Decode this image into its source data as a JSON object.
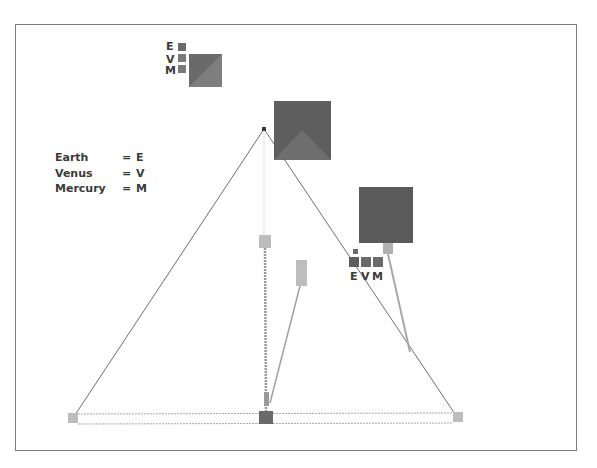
{
  "diagram": {
    "key": [
      {
        "name": "Earth",
        "eq": "=",
        "abbr": "E"
      },
      {
        "name": "Venus",
        "eq": "=",
        "abbr": "V"
      },
      {
        "name": "Mercury",
        "eq": "=",
        "abbr": "M"
      }
    ],
    "top_legend": {
      "labels": [
        "E",
        "V",
        "M"
      ]
    },
    "right_legend": {
      "labels": [
        "E",
        "V",
        "M"
      ]
    },
    "colors": {
      "frame": "#7a7a7a",
      "dark_block": "#5e5e5e",
      "medium_block": "#8a8a8a",
      "light_block": "#bdbdbd",
      "line": "#6e6e6e",
      "faint_line": "#b5b5b5"
    }
  }
}
